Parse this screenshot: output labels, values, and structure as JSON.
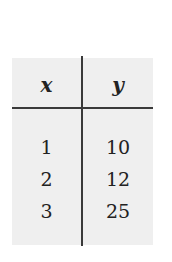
{
  "table": {
    "headers": [
      "x",
      "y"
    ],
    "rows": [
      [
        "1",
        "10"
      ],
      [
        "2",
        "12"
      ],
      [
        "3",
        "25"
      ]
    ]
  },
  "colors": {
    "panel_background": "#efefef",
    "rule": "#3a3a3a",
    "text": "#222222"
  }
}
